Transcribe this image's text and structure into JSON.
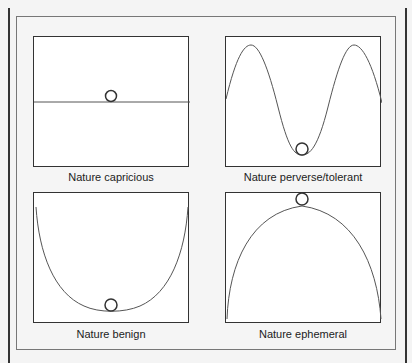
{
  "panels": [
    {
      "id": "capricious",
      "caption": "Nature capricious",
      "curve": "flat",
      "ball_position": "on flat line, center"
    },
    {
      "id": "perverse-tolerant",
      "caption": "Nature perverse/tolerant",
      "curve": "double-hump wave",
      "ball_position": "bottom of central valley"
    },
    {
      "id": "benign",
      "caption": "Nature benign",
      "curve": "U-shaped bowl",
      "ball_position": "bottom of bowl"
    },
    {
      "id": "ephemeral",
      "caption": "Nature ephemeral",
      "curve": "inverted dome",
      "ball_position": "top of dome"
    }
  ],
  "colors": {
    "curve": "#555555",
    "frame": "#333333",
    "background": "#f4f4f4"
  }
}
